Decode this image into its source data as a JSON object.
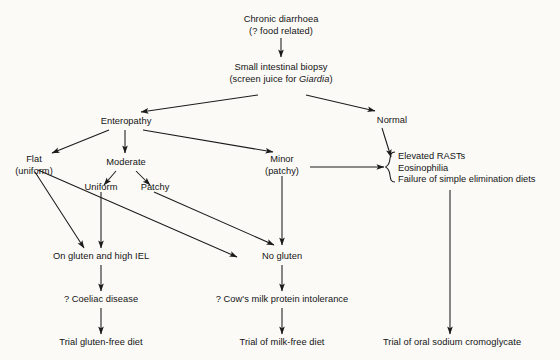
{
  "diagram": {
    "background_color": "#fbfaf7",
    "line_color": "#1a1a1a",
    "nodes": {
      "chronic_diarrhoea_l1": "Chronic diarrhoea",
      "chronic_diarrhoea_l2": "(? food related)",
      "biopsy_l1": "Small intestinal biopsy",
      "biopsy_l2_pre": "(screen juice for ",
      "biopsy_l2_italic": "Giardia",
      "biopsy_l2_post": ")",
      "enteropathy": "Enteropathy",
      "normal": "Normal",
      "flat_l1": "Flat",
      "flat_l2": "(uniform)",
      "moderate": "Moderate",
      "uniform": "Uniform",
      "patchy": "Patchy",
      "minor_l1": "Minor",
      "minor_l2": "(patchy)",
      "elevated_rasts": "Elevated RASTs",
      "eosinophilia": "Eosinophilia",
      "failure_elimination": "Failure of simple elimination diets",
      "on_gluten": "On gluten and high IEL",
      "no_gluten": "No gluten",
      "coeliac": "? Coeliac disease",
      "cows_milk": "? Cow's milk protein intolerance",
      "trial_gluten_free": "Trial gluten-free diet",
      "trial_milk_free": "Trial of milk-free diet",
      "trial_cromoglycate": "Trial of oral sodium cromoglycate"
    }
  }
}
